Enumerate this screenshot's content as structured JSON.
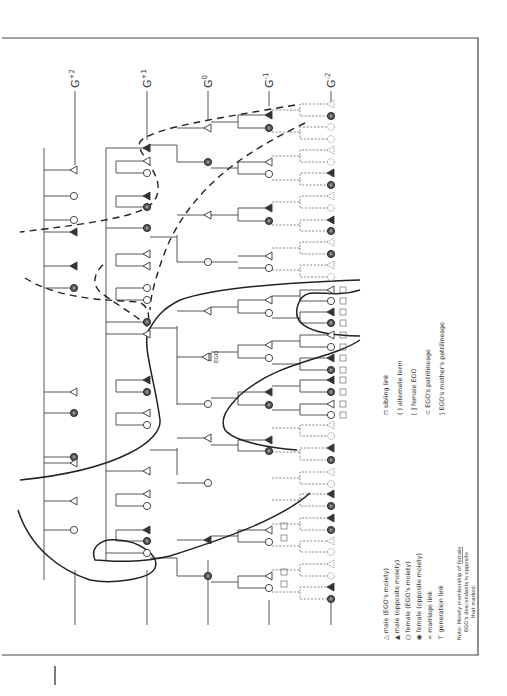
{
  "figure": {
    "generations": [
      "G+2",
      "G+1",
      "G0",
      "G-1",
      "G-2"
    ],
    "generation_labels": [
      {
        "base": "G",
        "sup": "+2"
      },
      {
        "base": "G",
        "sup": "+1"
      },
      {
        "base": "G",
        "sup": "0"
      },
      {
        "base": "G",
        "sup": "-1"
      },
      {
        "base": "G",
        "sup": "-2"
      }
    ],
    "ego_label": "EGO",
    "legend_left": [
      {
        "symbol": "male-ego-moiety",
        "glyph": "△",
        "label": "male (EGO's moiety)"
      },
      {
        "symbol": "male-opposite-moiety",
        "glyph": "▲",
        "label": "male (opposite moiety)"
      },
      {
        "symbol": "female-ego-moiety",
        "glyph": "○",
        "label": "female (EGO's moiety)"
      },
      {
        "symbol": "female-opposite-moiety",
        "glyph": "◉",
        "label": "female (opposite moiety)"
      },
      {
        "symbol": "marriage-link",
        "glyph": "=",
        "label": "marriage link"
      },
      {
        "symbol": "generation-link",
        "glyph": "⊤",
        "label": "generation link"
      }
    ],
    "legend_right": [
      {
        "symbol": "sibling-link",
        "glyph": "⊓",
        "label": "sibling link"
      },
      {
        "symbol": "alternate-term",
        "glyph": "( )",
        "label": "alternate term"
      },
      {
        "symbol": "female-ego",
        "glyph": "[ ]",
        "label": "female EGO"
      },
      {
        "symbol": "ego-patrilineage",
        "glyph": "⊂",
        "label": "EGO's patrilineage"
      },
      {
        "symbol": "ego-mothers-patrilineage",
        "glyph": "⟆",
        "label": "EGO's mother's patrilineage"
      }
    ],
    "note": {
      "prefix": "Note: Moiety membership of ",
      "underlined": "female",
      "line1_end": "",
      "line2": "EGO's descendants is opposite",
      "line3": "that marked."
    },
    "node_terms": {
      "g2": [
        "11",
        "12",
        "12",
        "11",
        "11",
        "12",
        "11",
        "12",
        "12",
        "11",
        "11",
        "12"
      ],
      "g1": [
        "1(/6)",
        "12",
        "6",
        "7",
        "4",
        "6",
        "7",
        "8",
        "8(/2)(1/2)",
        "3",
        "11",
        "12",
        "3",
        "5",
        "11",
        "9",
        "5",
        "3",
        "5",
        "9",
        "10",
        "5"
      ],
      "g0": [
        "6",
        "7",
        "8",
        "8",
        "1/2",
        "EGO",
        "1/2",
        "1/2",
        "1/2",
        "9",
        "10"
      ],
      "g_minus1": [
        "6",
        "7",
        "8",
        "8",
        "9",
        "10",
        "9",
        "10",
        "9",
        "10",
        "9",
        "10",
        "9",
        "10",
        "9",
        "10",
        "9",
        "10"
      ],
      "g_minus1_alt": [
        "(1/2)(1/2)"
      ],
      "g_minus2_boxed": [
        "a",
        "b",
        "a",
        "b",
        "a",
        "b",
        "a",
        "b",
        "a",
        "b",
        "a",
        "b",
        "a",
        "b",
        "a",
        "b"
      ]
    }
  }
}
